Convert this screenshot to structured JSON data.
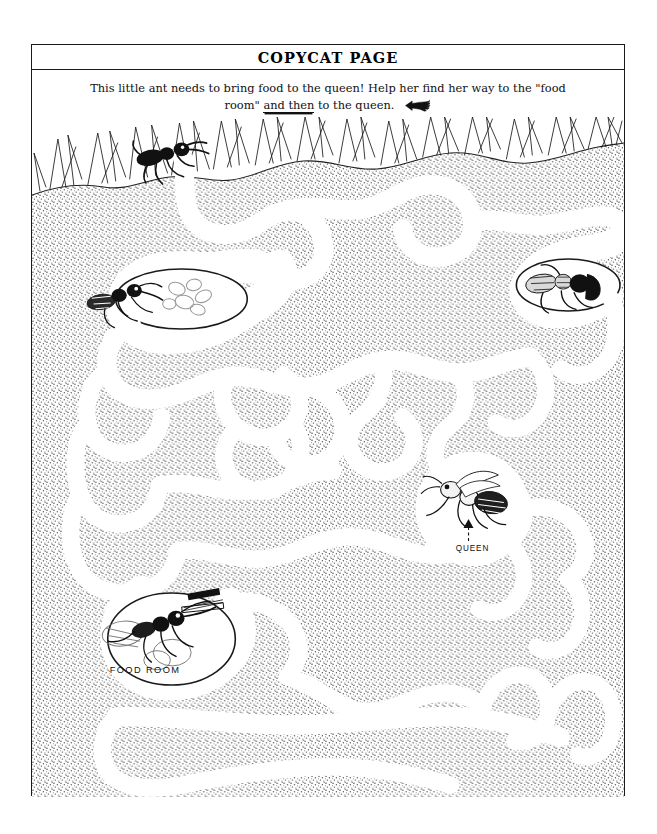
{
  "page": {
    "title": "COPYCAT PAGE",
    "instructions_line1": "This little ant needs to bring food to the queen! Help her find her way to the \"food",
    "instructions_line2_pre": "room\" ",
    "instructions_line2_emphasis": "and then",
    "instructions_line2_post": " to the queen.",
    "hand_icon": "pointing-hand-left-icon"
  },
  "maze": {
    "labels": {
      "food_room": "FOOD ROOM",
      "queen": "QUEEN"
    },
    "colors": {
      "ink": "#1a1a1a",
      "soil_stipple": "#d8d8d8",
      "passage": "#ffffff",
      "paper": "#ffffff"
    },
    "features": {
      "surface_ant": "ant-at-entrance",
      "grass": "grass-blades",
      "nursery_ant": "ant-with-eggs",
      "dead_end_ant": "ant-dead-end-right",
      "food_room_ant": "ant-with-food",
      "queen_ant": "queen-ant"
    }
  }
}
